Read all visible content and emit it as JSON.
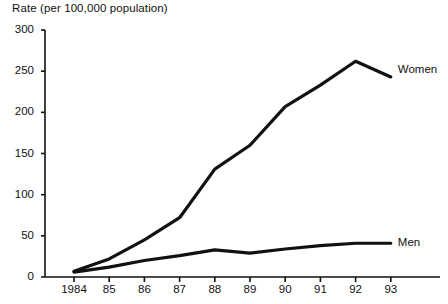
{
  "chart_data": {
    "type": "line",
    "title": "Rate (per 100,000 population)",
    "xlabel": "",
    "ylabel": "Rate (per 100,000 population)",
    "x": [
      "1984",
      "85",
      "86",
      "87",
      "88",
      "89",
      "90",
      "91",
      "92",
      "93"
    ],
    "xtick_labels": [
      "1984",
      "85",
      "86",
      "87",
      "88",
      "89",
      "90",
      "91",
      "92",
      "93"
    ],
    "ytick_labels": [
      "0",
      "50",
      "100",
      "150",
      "200",
      "250",
      "300"
    ],
    "yticks": [
      0,
      50,
      100,
      150,
      200,
      250,
      300
    ],
    "ylim": [
      0,
      300
    ],
    "grid": false,
    "legend_position": "inline-right",
    "series": [
      {
        "name": "Women",
        "label": "Women",
        "color": "#111111",
        "values": [
          7,
          22,
          45,
          72,
          131,
          160,
          207,
          233,
          262,
          243
        ]
      },
      {
        "name": "Men",
        "label": "Men",
        "color": "#111111",
        "values": [
          6,
          12,
          20,
          26,
          33,
          29,
          34,
          38,
          41,
          41
        ]
      }
    ]
  },
  "labels": {
    "women": "Women",
    "men": "Men"
  }
}
